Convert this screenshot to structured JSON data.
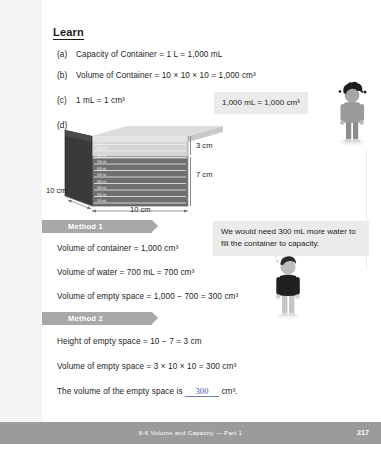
{
  "page": {
    "heading": "Learn",
    "page_number": "217",
    "footer_text": "8-6  Volume and Capacity — Part 1",
    "accent_banner_color": "#a8a8a8",
    "bubble_bg_color": "#ebebeb",
    "answer_ink_color": "#3c56a5"
  },
  "learn_items": [
    {
      "label": "(a)",
      "text": "Capacity of Container = 1 L = 1,000 mL"
    },
    {
      "label": "(b)",
      "text": "Volume of Container = 10 × 10 × 10 = 1,000 cm³"
    },
    {
      "label": "(c)",
      "text": "1 mL = 1 cm³"
    },
    {
      "label": "(d)",
      "text": ""
    }
  ],
  "callouts": [
    {
      "name": "equivalence-callout",
      "text": "1,000 mL = 1,000 cm³"
    },
    {
      "name": "more-water-callout",
      "text": "We would need 300 mL more water to fill the container to capacity."
    }
  ],
  "diagram": {
    "height_empty_label": "3 cm",
    "height_water_label": "7 cm",
    "depth_label": "10 cm",
    "width_label": "10 cm",
    "scale_marks": [
      "1 L",
      "900 mL",
      "800 mL",
      "700 mL",
      "600 mL",
      "500 mL",
      "400 mL",
      "300 mL",
      "200 mL",
      "100 mL"
    ]
  },
  "methods": [
    {
      "banner": "Method 1",
      "lines": [
        "Volume of container = 1,000 cm³",
        "Volume of water = 700 mL = 700 cm³",
        "Volume of empty space = 1,000 − 700 = 300 cm³"
      ]
    },
    {
      "banner": "Method 2",
      "lines": [
        "Height of empty space = 10 − 7 = 3 cm",
        "Volume of empty space = 3 × 10 × 10 = 300 cm³"
      ],
      "answer_prefix": "The volume of the empty space is",
      "answer_value": "300",
      "answer_suffix": "cm³."
    }
  ]
}
